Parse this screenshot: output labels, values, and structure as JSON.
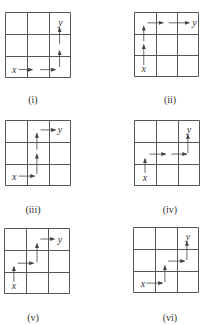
{
  "colors": {
    "grid": "#555555",
    "arrow": "#444444",
    "text": "#333333"
  },
  "start_label": "x",
  "end_label": "y",
  "panels": [
    {
      "label": "(i)",
      "grid": {
        "left": 5,
        "top": 12,
        "size": 66
      },
      "caption": {
        "cx": 33,
        "y": 94
      },
      "start": {
        "cx": 0.42,
        "cy": 2.62
      },
      "end": {
        "cx": 2.48,
        "cy": 0.48
      },
      "arrows": [
        [
          0.62,
          2.62,
          1.25,
          2.62
        ],
        [
          1.6,
          2.62,
          2.3,
          2.62
        ],
        [
          2.48,
          2.5,
          2.48,
          1.75
        ],
        [
          2.48,
          1.45,
          2.48,
          0.7
        ]
      ]
    },
    {
      "label": "(ii)",
      "grid": {
        "left": 134,
        "top": 12,
        "size": 65
      },
      "caption": {
        "cx": 170,
        "y": 94
      },
      "start": {
        "cx": 0.45,
        "cy": 2.62
      },
      "end": {
        "cx": 2.75,
        "cy": 0.5
      },
      "arrows": [
        [
          0.45,
          2.45,
          0.45,
          1.5
        ],
        [
          0.45,
          1.35,
          0.45,
          0.65
        ],
        [
          0.62,
          0.5,
          1.35,
          0.5
        ],
        [
          1.6,
          0.5,
          2.55,
          0.5
        ]
      ]
    },
    {
      "label": "(iii)",
      "grid": {
        "left": 5,
        "top": 120,
        "size": 66
      },
      "caption": {
        "cx": 33,
        "y": 204
      },
      "start": {
        "cx": 0.42,
        "cy": 2.55
      },
      "end": {
        "cx": 2.45,
        "cy": 0.45
      },
      "arrows": [
        [
          0.62,
          2.55,
          1.35,
          2.55
        ],
        [
          1.45,
          2.45,
          1.45,
          1.55
        ],
        [
          1.45,
          1.35,
          1.45,
          0.6
        ],
        [
          1.62,
          0.45,
          2.3,
          0.45
        ]
      ]
    },
    {
      "label": "(iv)",
      "grid": {
        "left": 134,
        "top": 120,
        "size": 66
      },
      "caption": {
        "cx": 170,
        "y": 204
      },
      "start": {
        "cx": 0.5,
        "cy": 2.6
      },
      "end": {
        "cx": 2.45,
        "cy": 0.45
      },
      "arrows": [
        [
          0.5,
          2.4,
          0.5,
          1.75
        ],
        [
          0.7,
          1.55,
          1.45,
          1.55
        ],
        [
          1.7,
          1.55,
          2.4,
          1.55
        ],
        [
          2.45,
          1.5,
          2.45,
          0.65
        ]
      ]
    },
    {
      "label": "(v)",
      "grid": {
        "left": 4,
        "top": 228,
        "size": 66
      },
      "caption": {
        "cx": 33,
        "y": 312
      },
      "start": {
        "cx": 0.45,
        "cy": 2.62
      },
      "end": {
        "cx": 2.5,
        "cy": 0.5
      },
      "arrows": [
        [
          0.45,
          2.45,
          0.45,
          1.75
        ],
        [
          0.62,
          1.6,
          1.35,
          1.6
        ],
        [
          1.5,
          1.55,
          1.5,
          0.7
        ],
        [
          1.65,
          0.5,
          2.3,
          0.5
        ]
      ]
    },
    {
      "label": "(vi)",
      "grid": {
        "left": 133,
        "top": 227,
        "size": 66
      },
      "caption": {
        "cx": 170,
        "y": 312
      },
      "start": {
        "cx": 0.45,
        "cy": 2.55
      },
      "end": {
        "cx": 2.45,
        "cy": 0.45
      },
      "arrows": [
        [
          0.62,
          2.55,
          1.35,
          2.55
        ],
        [
          1.45,
          2.5,
          1.45,
          1.75
        ],
        [
          1.6,
          1.55,
          2.35,
          1.55
        ],
        [
          2.45,
          1.5,
          2.45,
          0.65
        ]
      ]
    }
  ]
}
